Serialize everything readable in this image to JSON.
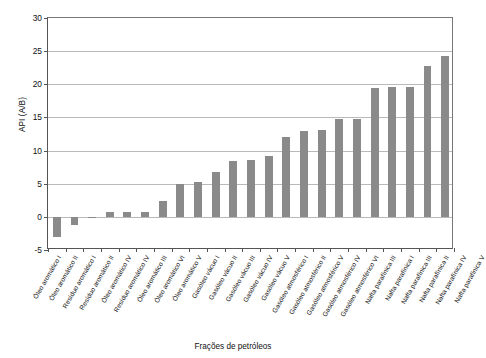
{
  "chart_data": {
    "type": "bar",
    "title": "",
    "xlabel": "Frações de petróleos",
    "ylabel": "API (A/B)",
    "ylim": [
      -5,
      30
    ],
    "ytick_labels": [
      "30",
      "25",
      "20",
      "15",
      "10",
      "5",
      "0",
      "-5"
    ],
    "yticks": [
      30,
      25,
      20,
      15,
      10,
      5,
      0,
      -5
    ],
    "grid": true,
    "legend": "none",
    "bar_color": "#8a8a8a",
    "categories": [
      "Óleo aromático I",
      "Óleo aromático II",
      "Resíduo aromático I",
      "Resíduo aromático II",
      "Óleo aromático IV",
      "Resíduo aromático IV",
      "Óleo aromático III",
      "Óleo aromático VI",
      "Óleo aromático V",
      "Gasóleo vácuo I",
      "Gasóleo vácuo II",
      "Gasóleo vácuo III",
      "Gasóleo vácuo IV",
      "Gasóleo vácuo V",
      "Gasóleo atmosférico I",
      "Gasóleo atmosférico II",
      "Gasóleo atmosférico V",
      "Gasóleo atmosférico IV",
      "Gasóleo atmosférico VI",
      "Nafta parafínica III",
      "Nafta parafínica I",
      "Nafta parafínica III",
      "Nafta parafínica II",
      "Nafta parafínica IV",
      "Nafta parafínica V"
    ],
    "values": [
      -3.0,
      -1.3,
      -0.1,
      0.7,
      0.8,
      0.8,
      2.4,
      5.0,
      5.2,
      6.8,
      8.4,
      8.6,
      9.2,
      12.1,
      12.9,
      13.1,
      14.7,
      14.7,
      19.4,
      19.6,
      19.6,
      22.8,
      24.2,
      14.7,
      19.4
    ],
    "values_plotted": [
      -3.0,
      -1.3,
      -0.1,
      0.7,
      0.8,
      0.8,
      2.4,
      5.0,
      5.2,
      6.8,
      8.4,
      8.6,
      9.2,
      12.1,
      12.9,
      13.1,
      14.7,
      14.7,
      19.4,
      19.6,
      19.6,
      22.8,
      24.2
    ]
  }
}
